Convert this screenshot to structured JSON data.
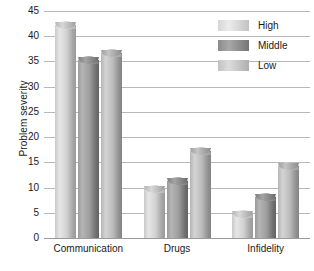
{
  "chart_data": {
    "type": "bar",
    "title": "",
    "xlabel": "",
    "ylabel": "Problem severity",
    "categories": [
      "Communication",
      "Drugs",
      "Infidelity"
    ],
    "series": [
      {
        "name": "High",
        "values": [
          43,
          10.5,
          5.5
        ]
      },
      {
        "name": "Middle",
        "values": [
          36,
          12,
          9
        ]
      },
      {
        "name": "Low",
        "values": [
          37.5,
          18,
          15
        ]
      }
    ],
    "ylim": [
      0,
      45
    ],
    "ytick_labels": [
      "0",
      "5",
      "10",
      "15",
      "20",
      "25",
      "30",
      "35",
      "40",
      "45"
    ],
    "ytick_values": [
      0,
      5,
      10,
      15,
      20,
      25,
      30,
      35,
      40,
      45
    ],
    "grid": true,
    "legend_position": "top-right",
    "colors": {
      "high": "#d5d5d5",
      "middle": "#8a8a8a",
      "low": "#c2c2c2",
      "gridline": "#b8b8b8",
      "text": "#1a1a1a"
    }
  }
}
